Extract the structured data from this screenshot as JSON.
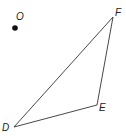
{
  "diagram": {
    "type": "geometry-triangle-with-point",
    "point": {
      "label": "O",
      "x": 15,
      "y": 28,
      "label_x": 16,
      "label_y": 20
    },
    "triangle": {
      "vertices": [
        {
          "label": "D",
          "x": 14,
          "y": 127,
          "label_x": 2,
          "label_y": 131
        },
        {
          "label": "E",
          "x": 97,
          "y": 105,
          "label_x": 99,
          "label_y": 111
        },
        {
          "label": "F",
          "x": 113,
          "y": 17,
          "label_x": 115,
          "label_y": 16
        }
      ],
      "stroke": "#333333"
    },
    "point_color": "#111111"
  }
}
